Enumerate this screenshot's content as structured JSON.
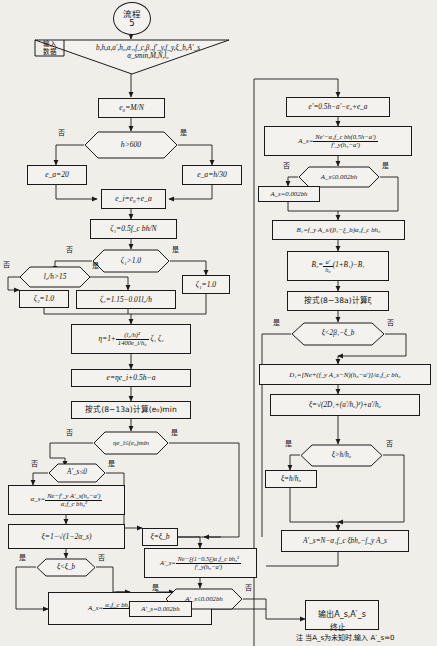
{
  "chart_meta": {
    "title": "流程 5",
    "doc_type": "flowchart",
    "language": "zh-CN",
    "background_color": "#efeee9",
    "line_color": "#1a1a1a"
  },
  "start": {
    "label_line1": "流程",
    "label_line2": "5"
  },
  "input": {
    "tag": "输入\n数据",
    "tag_line1": "输入",
    "tag_line2": "数据",
    "line1": "b,h,a,a′,h₀,α₁,f_c,β₁,f′_y,f_y,ξ_b,A′_s",
    "line2": "α_smin,M,N,l₀"
  },
  "left_column": {
    "n_e0": "e₀=M/N",
    "d_h600": "h>600",
    "d_h600_no": "否",
    "d_h600_yes": "是",
    "n_ea20": "e_a=20",
    "n_eah30": "e_a=h/30",
    "n_ei": "e_i=e₀+e_a",
    "n_zeta1": "ζ₁=0.5f_c bh/N",
    "d_zeta1": "ζ₁>1.0",
    "d_zeta1_no": "否",
    "d_zeta1_yes": "是",
    "n_zeta1_eq1": "ζ₁=1.0",
    "d_l0h": "l₀/h>15",
    "d_l0h_no": "否",
    "d_l0h_yes": "是",
    "n_zeta2_eq1": "ζ₂=1.0",
    "n_zeta2": "ζ₂=1.15−0.01l₀/h",
    "n_eta_num": "(l₀/h)²",
    "n_eta_den": "1400e_i/h₀",
    "n_eta_pre": "η=1+",
    "n_eta_post": "ζ₁ ζ₂",
    "n_e": "e=ηe_i+0.5h−a",
    "n_formula813a": "按式(8−13a)计算(e₀)min",
    "d_eta_ei": "ηe_i≤(e₀)min",
    "d_eta_ei_no": "否",
    "d_eta_ei_yes": "是",
    "d_As0": "A′_s≤0",
    "d_As0_no": "否",
    "d_As0_yes": "是",
    "n_alpha_s_pre": "α_s=",
    "n_alpha_s_num": "Ne−f′_y A′_s(h₀−a′)",
    "n_alpha_s_den": "α₁f_c bh₀²",
    "n_xi_sqrt": "ξ=1−√(1−2α_s)",
    "d_xi_xib": "ξ<ξ_b",
    "d_xi_xib_yes": "是",
    "d_xi_xib_no": "否",
    "n_As_final_pre": "A_s=",
    "n_As_final_num": "α₁f_c bh₀ξ+f′_y A′_s−N",
    "n_As_final_den": "f_y"
  },
  "middle_column": {
    "n_xi_eq_xib": "ξ=ξ_b",
    "n_Asprime_pre": "A′_s=",
    "n_Asprime_num": "Ne−ξ(1−0.5ξ)α₁f_c bh₀²",
    "n_Asprime_den": "f′_y(h₀−a′)",
    "d_Asprime_002": "A′_s≤0.002bh",
    "d_Asprime_002_yes": "是",
    "d_Asprime_002_no": "否",
    "n_Asprime_002": "A′_s=0.002bh"
  },
  "right_column": {
    "n_eprime": "e′=0.5h−a′−e₀+e_a",
    "n_As_pre": "A_s=",
    "n_As_num": "Ne′−α₁f_c bh(0.5h−a′)",
    "n_As_den": "f′_y(h₀−a′)",
    "d_As_002": "A_s≤0.002bh",
    "d_As_002_no": "否",
    "d_As_002_yes": "是",
    "n_As_002": "A_s=0.002bh",
    "n_B1": "B₁=f_y A_s/(β₁−ξ_b)α₁f_c bh₀",
    "n_B2_pre": "B₂=",
    "n_B2_num": "a′",
    "n_B2_den": "h₀",
    "n_B2_post": "(1+B₁)−B₁",
    "n_formula838a": "按式(8−38a)计算ξ",
    "d_xi_2beta": "ξ<2β₁−ξ_b",
    "d_xi_2beta_yes": "是",
    "d_xi_2beta_no": "否",
    "n_D1": "D₁=[Ne+(f_y A_s−N)(h₀−a′)]/α₁f_c bh₀",
    "n_xi_sqrtD": "ξ=√(2D₁+(a′/h₀)²)+a′/h₀",
    "d_xi_hh0": "ξ>h/h₀",
    "d_xi_hh0_yes": "是",
    "d_xi_hh0_no": "否",
    "n_xi_hh0": "ξ=h/h₀",
    "n_Asprime_right": "A′_s=N−α₁f_c ξbh₀−f_y A_s"
  },
  "output": {
    "label": "输出A_s,A′_s",
    "terminator": "终止",
    "note": "注 当A_s为未知时,输入 A′_s=0"
  }
}
